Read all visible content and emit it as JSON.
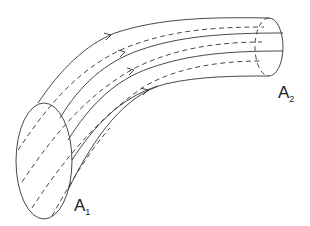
{
  "diagram": {
    "labels": {
      "inlet": {
        "main": "A",
        "sub": "1"
      },
      "outlet": {
        "main": "A",
        "sub": "2"
      }
    },
    "colors": {
      "stroke": "#333333",
      "background": "#ffffff"
    }
  }
}
